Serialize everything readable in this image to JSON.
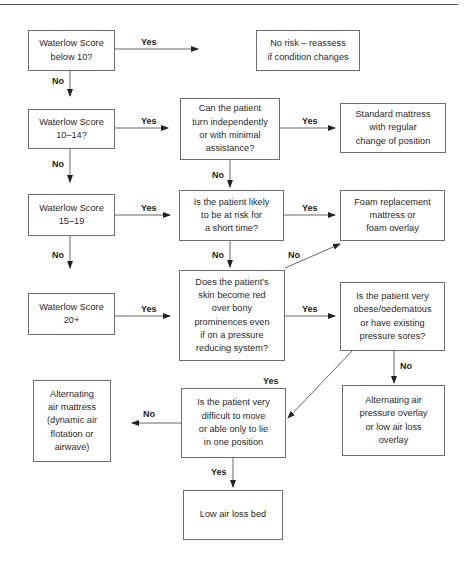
{
  "diagram": {
    "type": "flowchart",
    "nodes": {
      "q_below10": "Waterlow Score\nbelow 10?",
      "r_no_risk": "No risk – reassess\nif condition changes",
      "q_10_14": "Waterlow Score\n10–14?",
      "q_turn": "Can the patient\nturn independently\nor with minimal\nassistance?",
      "r_standard": "Standard mattress\nwith regular\nchange of position",
      "q_15_19": "Waterlow Score\n15–19",
      "q_short_time": "Is the patient likely\nto be at risk for\na short time?",
      "r_foam": "Foam replacement\nmattress or\nfoam overlay",
      "q_20plus": "Waterlow Score\n20+",
      "q_skin_red": "Does the patient’s\nskin become red\nover bony\nprominences even\nif on a pressure\nreducing system?",
      "q_obese": "Is the patient very\nobese/oedematous\nor have existing\npressure sores?",
      "r_alt_mattress": "Alternating\nair mattress\n(dynamic air\nflotation or\nairwave)",
      "q_difficult": "Is the patient very\ndifficult to move\nor able only to lie\nin one position",
      "r_alt_overlay": "Alternating air\npressure overlay\nor low air loss\noverlay",
      "r_low_air_bed": "Low air loss bed"
    },
    "edge_labels": {
      "below10_yes": "Yes",
      "below10_no": "No",
      "s10_14_yes": "Yes",
      "s10_14_no": "No",
      "turn_yes": "Yes",
      "turn_no": "No",
      "s15_19_yes": "Yes",
      "s15_19_no": "No",
      "short_yes": "Yes",
      "short_no": "No",
      "skin_no": "No",
      "s20_yes": "Yes",
      "skin_yes": "Yes",
      "obese_no": "No",
      "obese_yes": "Yes",
      "difficult_no": "No",
      "difficult_yes": "Yes"
    }
  }
}
